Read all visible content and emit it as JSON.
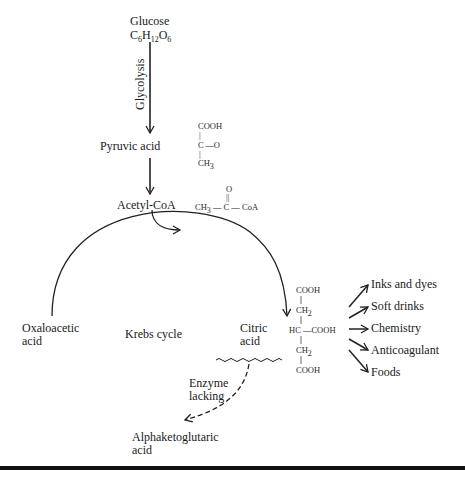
{
  "diagram": {
    "start": {
      "name": "Glucose",
      "formula": {
        "c": "C",
        "c_n": "6",
        "h": "H",
        "h_n": "12",
        "o": "O",
        "o_n": "6"
      }
    },
    "glycolysis_label": "Glycolysis",
    "pyruvic": {
      "label": "Pyruvic acid",
      "structure": {
        "top": "COOH",
        "bond1": "|",
        "middle": "C —O",
        "bond2": "|",
        "bottom_base": "CH",
        "bottom_sub": "3"
      }
    },
    "acetyl": {
      "label": "Acetyl-CoA",
      "structure": {
        "o": "O",
        "double": "||",
        "ch3": "CH",
        "ch3_sub": "3",
        "chain": "— C — CoA"
      }
    },
    "cycle": {
      "center_label": "Krebs cycle",
      "left_label_1": "Oxaloacetic",
      "left_label_2": "acid",
      "right_label_1": "Citric",
      "right_label_2": "acid"
    },
    "citric_structure": {
      "r1": "COOH",
      "r2_base": "CH",
      "r2_sub": "2",
      "r3": "HC —COOH",
      "r4_base": "CH",
      "r4_sub": "2",
      "r5": "COOH"
    },
    "uses": [
      "Inks and dyes",
      "Soft drinks",
      "Chemistry",
      "Anticoagulant",
      "Foods"
    ],
    "blocked": {
      "label_1": "Enzyme",
      "label_2": "lacking",
      "target_1": "Alphaketoglutaric",
      "target_2": "acid"
    }
  }
}
